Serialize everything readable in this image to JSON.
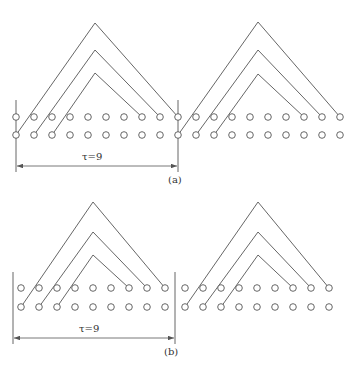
{
  "figure": {
    "panels": [
      {
        "id": "a",
        "caption": "(a)",
        "tau_label": "τ=9",
        "tau_value": 9,
        "top_row_y": 117,
        "bottom_row_y": 135,
        "circle_xs": [
          16,
          34,
          52,
          70,
          88,
          106,
          124,
          142,
          160,
          178,
          196,
          214,
          232,
          250,
          268,
          286,
          304,
          322,
          340
        ],
        "boundary_lines": [
          {
            "x": 16,
            "y1": 100,
            "y2": 172
          },
          {
            "x": 178,
            "y1": 100,
            "y2": 172
          }
        ],
        "dimension": {
          "x1": 16,
          "x2": 178,
          "y": 166
        },
        "groups": [
          {
            "chevrons": [
              {
                "from_x": 16,
                "peak": [
                  95,
                  23
                ],
                "to_x": 178
              },
              {
                "from_x": 34,
                "peak": [
                  95,
                  50
                ],
                "to_x": 160
              },
              {
                "from_x": 52,
                "peak": [
                  95,
                  73
                ],
                "to_x": 142
              }
            ]
          },
          {
            "chevrons": [
              {
                "from_x": 178,
                "peak": [
                  258,
                  22
                ],
                "to_x": 340
              },
              {
                "from_x": 196,
                "peak": [
                  258,
                  50
                ],
                "to_x": 322
              },
              {
                "from_x": 214,
                "peak": [
                  258,
                  74
                ],
                "to_x": 304
              }
            ]
          }
        ]
      },
      {
        "id": "b",
        "caption": "(b)",
        "tau_label": "τ=9",
        "tau_value": 9,
        "top_row_y": 288,
        "bottom_row_y": 307,
        "circle_xs": [
          21,
          39,
          57,
          75,
          93,
          111,
          129,
          147,
          165,
          185,
          203,
          221,
          239,
          257,
          275,
          293,
          311,
          329
        ],
        "boundary_lines": [
          {
            "x": 13,
            "y1": 272,
            "y2": 344
          },
          {
            "x": 175,
            "y1": 272,
            "y2": 344
          }
        ],
        "dimension": {
          "x1": 13,
          "x2": 175,
          "y": 338
        },
        "groups": [
          {
            "chevrons": [
              {
                "from_x": 21,
                "peak": [
                  93,
                  202
                ],
                "to_x": 165
              },
              {
                "from_x": 39,
                "peak": [
                  93,
                  232
                ],
                "to_x": 147
              },
              {
                "from_x": 57,
                "peak": [
                  93,
                  255
                ],
                "to_x": 129
              }
            ]
          },
          {
            "chevrons": [
              {
                "from_x": 185,
                "peak": [
                  258,
                  202
                ],
                "to_x": 329
              },
              {
                "from_x": 203,
                "peak": [
                  258,
                  232
                ],
                "to_x": 311
              },
              {
                "from_x": 221,
                "peak": [
                  258,
                  255
                ],
                "to_x": 293
              }
            ]
          }
        ]
      }
    ],
    "colors": {
      "line": "#555555",
      "circle": "#555555",
      "background": "#ffffff"
    }
  }
}
